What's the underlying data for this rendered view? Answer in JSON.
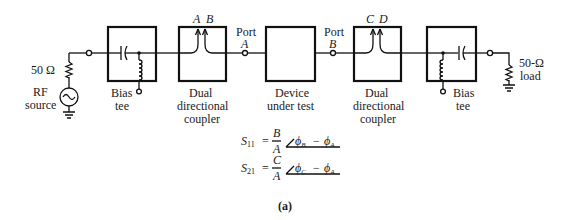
{
  "figure": {
    "caption": "(a)",
    "source": {
      "resistor_label": "50 Ω",
      "label_line1": "RF",
      "label_line2": "source"
    },
    "bias_tee_left": {
      "label_line1": "Bias",
      "label_line2": "tee"
    },
    "coupler_left": {
      "label_line1": "Dual",
      "label_line2": "directional",
      "label_line3": "coupler",
      "port1": "A",
      "port2": "B"
    },
    "port_a": {
      "label_line1": "Port",
      "label_line2": "A"
    },
    "dut": {
      "label_line1": "Device",
      "label_line2": "under test"
    },
    "port_b": {
      "label_line1": "Port",
      "label_line2": "B"
    },
    "coupler_right": {
      "label_line1": "Dual",
      "label_line2": "directional",
      "label_line3": "coupler",
      "port1": "C",
      "port2": "D"
    },
    "bias_tee_right": {
      "label_line1": "Bias",
      "label_line2": "tee"
    },
    "load": {
      "label_line1": "50-Ω",
      "label_line2": "load"
    }
  },
  "equations": {
    "s11": {
      "lhs": "S",
      "lhs_sub": "11",
      "num": "B",
      "den": "A",
      "phase_a": "ϕ",
      "phase_a_sub": "B",
      "phase_b": "ϕ",
      "phase_b_sub": "A"
    },
    "s21": {
      "lhs": "S",
      "lhs_sub": "21",
      "num": "C",
      "den": "A",
      "phase_a": "ϕ",
      "phase_a_sub": "C",
      "phase_b": "ϕ",
      "phase_b_sub": "A"
    }
  }
}
